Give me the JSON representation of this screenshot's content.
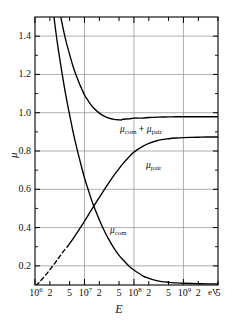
{
  "chart_data": {
    "type": "line",
    "title": "",
    "xlabel": "E",
    "xunits": "eV",
    "ylabel": "μ",
    "xscale": "log",
    "xlim": [
      1000000,
      5000000000
    ],
    "ylim": [
      0.1,
      1.5
    ],
    "yticks": [
      0.2,
      0.4,
      0.6,
      0.8,
      1.0,
      1.2,
      1.4
    ],
    "ytick_labels": [
      "0.2",
      "0.4",
      "0.6",
      "0.8",
      "1.0",
      "1.2",
      "1.4"
    ],
    "grid": true,
    "xtick_labels": [
      {
        "text": "10",
        "exp": "6",
        "x": 1000000,
        "major": true
      },
      {
        "text": "2",
        "exp": "",
        "x": 2000000,
        "major": false
      },
      {
        "text": "5",
        "exp": "",
        "x": 5000000,
        "major": false
      },
      {
        "text": "10",
        "exp": "7",
        "x": 10000000,
        "major": true
      },
      {
        "text": "2",
        "exp": "",
        "x": 20000000,
        "major": false
      },
      {
        "text": "5",
        "exp": "",
        "x": 50000000,
        "major": false
      },
      {
        "text": "10",
        "exp": "8",
        "x": 100000000,
        "major": true
      },
      {
        "text": "2",
        "exp": "",
        "x": 200000000,
        "major": false
      },
      {
        "text": "5",
        "exp": "",
        "x": 500000000,
        "major": false
      },
      {
        "text": "10",
        "exp": "9",
        "x": 1000000000,
        "major": true
      },
      {
        "text": "2",
        "exp": "",
        "x": 2000000000,
        "major": false
      },
      {
        "text": "5",
        "exp": "",
        "x": 5000000000,
        "major": false
      }
    ],
    "series": [
      {
        "name": "mu_com",
        "label_main": "μ",
        "label_sub": "com",
        "style": "solid",
        "points": [
          [
            1000000,
            2.55
          ],
          [
            1200000,
            2.3
          ],
          [
            1500000,
            2.0
          ],
          [
            2000000,
            1.68
          ],
          [
            2500000,
            1.47
          ],
          [
            3000000,
            1.32
          ],
          [
            4000000,
            1.12
          ],
          [
            5000000,
            0.99
          ],
          [
            6000000,
            0.89
          ],
          [
            7000000,
            0.815
          ],
          [
            8000000,
            0.755
          ],
          [
            10000000,
            0.66
          ],
          [
            12000000,
            0.595
          ],
          [
            15000000,
            0.52
          ],
          [
            20000000,
            0.44
          ],
          [
            25000000,
            0.385
          ],
          [
            30000000,
            0.345
          ],
          [
            40000000,
            0.29
          ],
          [
            50000000,
            0.255
          ],
          [
            60000000,
            0.232
          ],
          [
            80000000,
            0.198
          ],
          [
            100000000,
            0.178
          ],
          [
            150000000,
            0.148
          ],
          [
            200000000,
            0.135
          ],
          [
            300000000,
            0.122
          ],
          [
            500000000,
            0.114
          ],
          [
            700000000,
            0.111
          ],
          [
            1000000000,
            0.109
          ],
          [
            2000000000,
            0.107
          ],
          [
            3000000000,
            0.106
          ],
          [
            5000000000,
            0.106
          ]
        ]
      },
      {
        "name": "mu_pair_dashed",
        "label_main": "",
        "label_sub": "",
        "style": "dashed",
        "points": [
          [
            1050000,
            0.098
          ],
          [
            1200000,
            0.112
          ],
          [
            1400000,
            0.131
          ],
          [
            1700000,
            0.157
          ],
          [
            2000000,
            0.18
          ],
          [
            2500000,
            0.213
          ],
          [
            3000000,
            0.241
          ],
          [
            3500000,
            0.265
          ],
          [
            4000000,
            0.285
          ],
          [
            4500000,
            0.3
          ]
        ]
      },
      {
        "name": "mu_pair",
        "label_main": "μ",
        "label_sub": "pair",
        "style": "solid",
        "points": [
          [
            4500000,
            0.3
          ],
          [
            5000000,
            0.316
          ],
          [
            6000000,
            0.345
          ],
          [
            7000000,
            0.371
          ],
          [
            8000000,
            0.394
          ],
          [
            10000000,
            0.433
          ],
          [
            12000000,
            0.466
          ],
          [
            15000000,
            0.507
          ],
          [
            20000000,
            0.558
          ],
          [
            25000000,
            0.597
          ],
          [
            30000000,
            0.628
          ],
          [
            40000000,
            0.675
          ],
          [
            50000000,
            0.708
          ],
          [
            60000000,
            0.734
          ],
          [
            80000000,
            0.77
          ],
          [
            100000000,
            0.794
          ],
          [
            150000000,
            0.824
          ],
          [
            200000000,
            0.84
          ],
          [
            300000000,
            0.855
          ],
          [
            500000000,
            0.864
          ],
          [
            700000000,
            0.868
          ],
          [
            1000000000,
            0.87
          ],
          [
            2000000000,
            0.872
          ],
          [
            3000000000,
            0.873
          ],
          [
            5000000000,
            0.873
          ]
        ]
      },
      {
        "name": "mu_sum",
        "label_main": "μ",
        "label_sub": "com",
        "label_main2": "μ",
        "label_sub2": "pair",
        "label_op": "+",
        "style": "solid",
        "points": [
          [
            1000000,
            2.65
          ],
          [
            1200000,
            2.41
          ],
          [
            1500000,
            2.13
          ],
          [
            2000000,
            1.86
          ],
          [
            2500000,
            1.68
          ],
          [
            3000000,
            1.56
          ],
          [
            4000000,
            1.4
          ],
          [
            5000000,
            1.305
          ],
          [
            6000000,
            1.235
          ],
          [
            7000000,
            1.186
          ],
          [
            8000000,
            1.149
          ],
          [
            10000000,
            1.093
          ],
          [
            12000000,
            1.061
          ],
          [
            15000000,
            1.027
          ],
          [
            20000000,
            0.998
          ],
          [
            25000000,
            0.982
          ],
          [
            30000000,
            0.973
          ],
          [
            40000000,
            0.965
          ],
          [
            50000000,
            0.963
          ],
          [
            55000000,
            0.962
          ],
          [
            60000000,
            0.966
          ],
          [
            80000000,
            0.968
          ],
          [
            100000000,
            0.972
          ],
          [
            150000000,
            0.972
          ],
          [
            200000000,
            0.975
          ],
          [
            300000000,
            0.977
          ],
          [
            500000000,
            0.978
          ],
          [
            700000000,
            0.979
          ],
          [
            1000000000,
            0.979
          ],
          [
            2000000000,
            0.979
          ],
          [
            5000000000,
            0.979
          ]
        ]
      }
    ],
    "annotations": [
      {
        "name": "sum-curve-label",
        "text": "μcom + μpair",
        "x": 120,
        "y": 127
      },
      {
        "name": "pair-curve-label",
        "text": "μpair",
        "x": 145,
        "y": 163
      },
      {
        "name": "com-curve-label",
        "text": "μcom",
        "x": 110,
        "y": 228
      }
    ]
  },
  "colors": {
    "axis": "#000000",
    "grid": "#9a9a9a",
    "curve": "#000000",
    "background": "#ffffff"
  }
}
